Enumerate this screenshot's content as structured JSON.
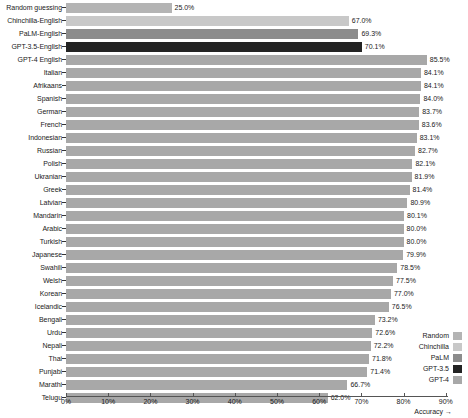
{
  "chart_data": {
    "type": "bar",
    "orientation": "horizontal",
    "title": "",
    "xlabel": "Accuracy →",
    "ylabel": "",
    "xlim": [
      0,
      95
    ],
    "grid": false,
    "legend_position": "bottom-right",
    "xticks": [
      "0%",
      "10%",
      "20%",
      "30%",
      "40%",
      "50%",
      "60%",
      "70%",
      "80%",
      "90%"
    ],
    "xtick_values": [
      0,
      10,
      20,
      30,
      40,
      50,
      60,
      70,
      80,
      90
    ],
    "categories": [
      "Random guessing",
      "Chinchilla-English",
      "PaLM-English",
      "GPT-3.5-English",
      "GPT-4 English",
      "Italian",
      "Afrikaans",
      "Spanish",
      "German",
      "French",
      "Indonesian",
      "Russian",
      "Polish",
      "Ukranian",
      "Greek",
      "Latvian",
      "Mandarin",
      "Arabic",
      "Turkish",
      "Japanese",
      "Swahili",
      "Welsh",
      "Korean",
      "Icelandic",
      "Bengali",
      "Urdu",
      "Nepali",
      "Thai",
      "Punjabi",
      "Marathi",
      "Telugu"
    ],
    "values": [
      25.0,
      67.0,
      69.3,
      70.1,
      85.5,
      84.1,
      84.1,
      84.0,
      83.7,
      83.6,
      83.1,
      82.7,
      82.1,
      81.9,
      81.4,
      80.9,
      80.1,
      80.0,
      80.0,
      79.9,
      78.5,
      77.5,
      77.0,
      76.5,
      73.2,
      72.6,
      72.2,
      71.8,
      71.4,
      66.7,
      62.0
    ],
    "value_labels": [
      "25.0%",
      "67.0%",
      "69.3%",
      "70.1%",
      "85.5%",
      "84.1%",
      "84.1%",
      "84.0%",
      "83.7%",
      "83.6%",
      "83.1%",
      "82.7%",
      "82.1%",
      "81.9%",
      "81.4%",
      "80.9%",
      "80.1%",
      "80.0%",
      "80.0%",
      "79.9%",
      "78.5%",
      "77.5%",
      "77.0%",
      "76.5%",
      "73.2%",
      "72.6%",
      "72.2%",
      "71.8%",
      "71.4%",
      "66.7%",
      "62.0%"
    ],
    "series_key": [
      "random",
      "chinchilla",
      "palm",
      "gpt35",
      "gpt4",
      "gpt4",
      "gpt4",
      "gpt4",
      "gpt4",
      "gpt4",
      "gpt4",
      "gpt4",
      "gpt4",
      "gpt4",
      "gpt4",
      "gpt4",
      "gpt4",
      "gpt4",
      "gpt4",
      "gpt4",
      "gpt4",
      "gpt4",
      "gpt4",
      "gpt4",
      "gpt4",
      "gpt4",
      "gpt4",
      "gpt4",
      "gpt4",
      "gpt4",
      "gpt4"
    ]
  },
  "legend": {
    "items": [
      {
        "label": "Random",
        "color": "#b4b4b4"
      },
      {
        "label": "Chinchilla",
        "color": "#c8c8c8"
      },
      {
        "label": "PaLM",
        "color": "#8c8c8c"
      },
      {
        "label": "GPT-3.5",
        "color": "#232323"
      },
      {
        "label": "GPT-4",
        "color": "#a8a8a8"
      }
    ]
  },
  "colors": {
    "random": "#b4b4b4",
    "chinchilla": "#c8c8c8",
    "palm": "#8c8c8c",
    "gpt35": "#232323",
    "gpt4": "#a8a8a8",
    "background": "#ffffff",
    "text": "#1a1a1a",
    "axis": "#555555"
  }
}
